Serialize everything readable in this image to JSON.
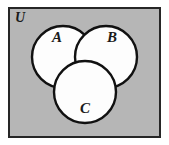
{
  "figure": {
    "name": "three-set-venn-diagram",
    "type": "venn-diagram",
    "sets": 3,
    "canvas": {
      "width": 169,
      "height": 145,
      "background": "#ffffff"
    },
    "universe": {
      "label": "U",
      "fill": "#b6b6b6",
      "stroke": "#262626",
      "stroke_width": 2,
      "x": 9,
      "y": 8,
      "width": 151,
      "height": 129,
      "label_x": 20,
      "label_y": 19
    },
    "circles": [
      {
        "label": "A",
        "cx": 63,
        "cy": 57,
        "r": 31,
        "fill": "#fdfdfd",
        "stroke": "#111111",
        "stroke_width": 2.4,
        "label_x": 57,
        "label_y": 39
      },
      {
        "label": "B",
        "cx": 106,
        "cy": 57,
        "r": 31,
        "fill": "#fdfdfd",
        "stroke": "#111111",
        "stroke_width": 2.4,
        "label_x": 112,
        "label_y": 39
      },
      {
        "label": "C",
        "cx": 85,
        "cy": 92,
        "r": 31,
        "fill": "#fdfdfd",
        "stroke": "#111111",
        "stroke_width": 2.4,
        "label_x": 85,
        "label_y": 110
      }
    ]
  }
}
